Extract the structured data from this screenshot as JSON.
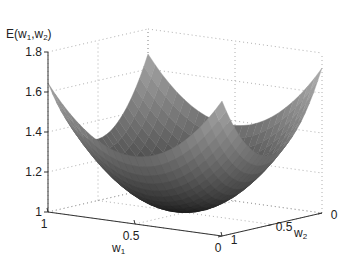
{
  "chart_data": {
    "type": "surface3d",
    "title": "",
    "xlabel": "w1",
    "ylabel": "w2",
    "zlabel": "E(w1,w2)",
    "xlim": [
      0,
      1
    ],
    "ylim": [
      0,
      1
    ],
    "zlim": [
      1,
      1.8
    ],
    "x_ticks": [
      "1",
      "0.5",
      "0"
    ],
    "y_ticks": [
      "1",
      "0.5",
      "0"
    ],
    "z_ticks": [
      "1",
      "1.2",
      "1.4",
      "1.6",
      "1.8"
    ],
    "grid": true,
    "colormap": "gray",
    "surface_description": "Convex bowl-shaped error surface with minimum near (0.5, 0.5) at E≈1.0; corners rise to ≈1.6–1.8",
    "corner_values": {
      "w1=1,w2=1": 1.62,
      "w1=0,w2=0": 1.72,
      "w1=1,w2=0": 1.75,
      "w1=0,w2=1": 1.58
    },
    "minimum": {
      "w1": 0.5,
      "w2": 0.5,
      "E": 1.0
    }
  },
  "labels": {
    "zlabel_main": "E(w",
    "zlabel_sub1": "1",
    "zlabel_mid": ",w",
    "zlabel_sub2": "2",
    "zlabel_end": ")",
    "xlabel_main": "w",
    "xlabel_sub": "1",
    "ylabel_main": "w",
    "ylabel_sub": "2"
  }
}
